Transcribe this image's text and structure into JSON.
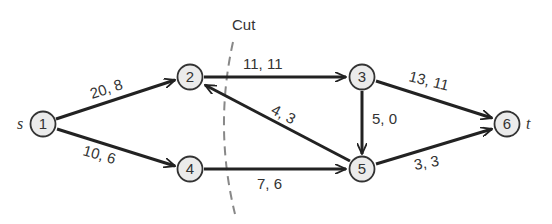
{
  "diagram": {
    "type": "flow-network",
    "cut_label": "Cut",
    "source_label": "s",
    "sink_label": "t",
    "nodes": [
      {
        "id": "1",
        "label": "1",
        "x": 43,
        "y": 124
      },
      {
        "id": "2",
        "label": "2",
        "x": 190,
        "y": 77
      },
      {
        "id": "3",
        "label": "3",
        "x": 362,
        "y": 77
      },
      {
        "id": "4",
        "label": "4",
        "x": 190,
        "y": 169
      },
      {
        "id": "5",
        "label": "5",
        "x": 362,
        "y": 169
      },
      {
        "id": "6",
        "label": "6",
        "x": 507,
        "y": 124
      }
    ],
    "edges": [
      {
        "from": "1",
        "to": "2",
        "label": "20, 8"
      },
      {
        "from": "1",
        "to": "4",
        "label": "10, 6"
      },
      {
        "from": "2",
        "to": "3",
        "label": "11, 11"
      },
      {
        "from": "5",
        "to": "2",
        "label": "4, 3"
      },
      {
        "from": "4",
        "to": "5",
        "label": "7, 6"
      },
      {
        "from": "3",
        "to": "5",
        "label": "5, 0"
      },
      {
        "from": "3",
        "to": "6",
        "label": "13, 11"
      },
      {
        "from": "5",
        "to": "6",
        "label": "3, 3"
      }
    ]
  }
}
